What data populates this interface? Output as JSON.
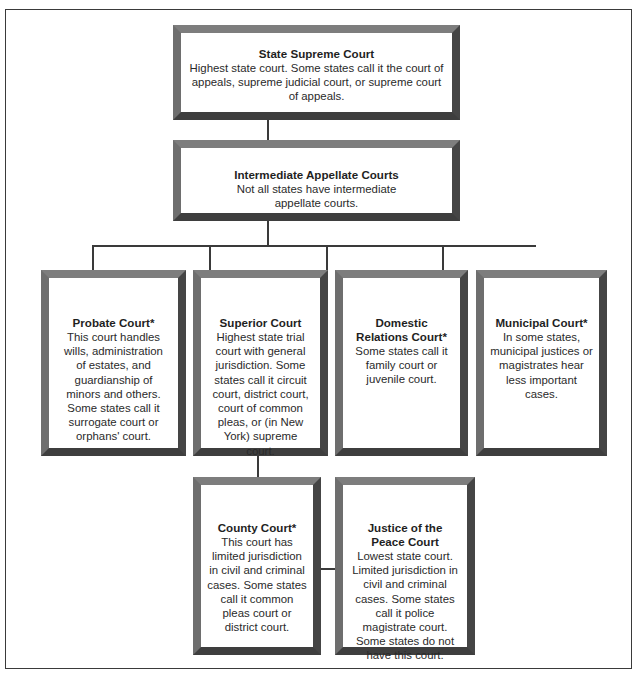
{
  "diagram": {
    "type": "org-chart",
    "nodes": [
      {
        "id": "state-supreme",
        "title": "State Supreme Court",
        "description": "Highest state court. Some states call it the court of appeals, supreme judicial court, or supreme court of appeals.",
        "lines": [
          "Highest state court. Some states call it the court of",
          "appeals, supreme judicial court, or supreme court",
          "of appeals."
        ]
      },
      {
        "id": "intermediate-appellate",
        "title": "Intermediate Appellate Courts",
        "description": "Not all states have intermediate appellate courts.",
        "lines": [
          "Not all states have intermediate",
          "appellate courts."
        ]
      },
      {
        "id": "probate",
        "title": "Probate Court*",
        "description": "This court handles wills, administration of estates, and guardianship of minors and others. Some states call it surrogate court or orphans' court.",
        "lines": [
          "This court handles",
          "wills, administration",
          "of estates, and",
          "guardianship of",
          "minors and others.",
          "Some states call it",
          "surrogate court or",
          "orphans' court."
        ]
      },
      {
        "id": "superior",
        "title": "Superior Court",
        "description": "Highest state trial court with general jurisdiction. Some states call it circuit court, district court, court of common pleas, or (in New York) supreme court.",
        "lines": [
          "Highest state trial",
          "court with general",
          "jurisdiction. Some",
          "states call it circuit",
          "court, district court,",
          "court of common",
          "pleas, or (in New",
          "York) supreme",
          "court."
        ]
      },
      {
        "id": "domestic-relations",
        "title_lines": [
          "Domestic",
          "Relations Court*"
        ],
        "title": "Domestic Relations Court*",
        "description": "Some states call it family court or juvenile court.",
        "lines": [
          "Some states call it",
          "family court or",
          "juvenile court."
        ]
      },
      {
        "id": "municipal",
        "title": "Municipal Court*",
        "description": "In some states, municipal justices or magistrates hear less important cases.",
        "lines": [
          "In some states,",
          "municipal justices or",
          "magistrates hear",
          "less important",
          "cases."
        ]
      },
      {
        "id": "county",
        "title": "County Court*",
        "description": "This court has limited jurisdiction in civil and criminal cases. Some states call it common pleas court or district court.",
        "lines": [
          "This court has",
          "limited jurisdiction",
          "in civil and criminal",
          "cases. Some states",
          "call it common",
          "pleas court or",
          "district court."
        ]
      },
      {
        "id": "justice-of-the-peace",
        "title_lines": [
          "Justice of the",
          "Peace Court"
        ],
        "title": "Justice of the Peace Court",
        "description": "Lowest state court. Limited jurisdiction in civil and criminal cases. Some states call it police magistrate court. Some states do not have this court.",
        "lines": [
          "Lowest state court.",
          "Limited jurisdiction in",
          "civil and criminal",
          "cases. Some states",
          "call it police",
          "magistrate court.",
          "Some states do not",
          "have this court."
        ]
      }
    ],
    "edges": [
      {
        "from": "state-supreme",
        "to": "intermediate-appellate"
      },
      {
        "from": "intermediate-appellate",
        "to": "probate"
      },
      {
        "from": "intermediate-appellate",
        "to": "superior"
      },
      {
        "from": "intermediate-appellate",
        "to": "domestic-relations"
      },
      {
        "from": "intermediate-appellate",
        "to": "municipal"
      },
      {
        "from": "superior",
        "to": "county"
      },
      {
        "from": "superior",
        "to": "justice-of-the-peace"
      }
    ],
    "colors": {
      "frame_light": "#7d7d7d",
      "frame_dark": "#3e3e3e",
      "line": "#3a3a3a",
      "background": "#ffffff"
    }
  }
}
